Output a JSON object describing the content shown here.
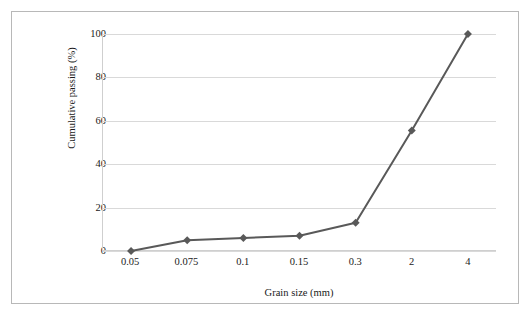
{
  "chart_data": {
    "type": "line",
    "title": "",
    "subtitle": "",
    "xlabel": "Grain size (mm)",
    "ylabel": "Cumulative passing (%)",
    "categories": [
      "0.05",
      "0.075",
      "0.1",
      "0.15",
      "0.3",
      "2",
      "4"
    ],
    "series": [
      {
        "name": "Cumulative passing",
        "values": [
          0,
          5,
          6,
          7,
          13,
          55.5,
          100
        ],
        "color": "#595959",
        "marker": "diamond",
        "line_width": 2
      }
    ],
    "yticks": [
      0,
      20,
      40,
      60,
      80,
      100
    ],
    "ytick_labels": [
      "0",
      "20",
      "40",
      "60",
      "80",
      "100"
    ],
    "ylim": [
      0,
      100
    ],
    "grid": true,
    "grid_axis": "y",
    "grid_color": "#d9d9d9",
    "legend": false,
    "legend_position": "none",
    "axis_color": "#cfcfcf",
    "frame_color": "#b8b8b8",
    "background": "#ffffff"
  }
}
